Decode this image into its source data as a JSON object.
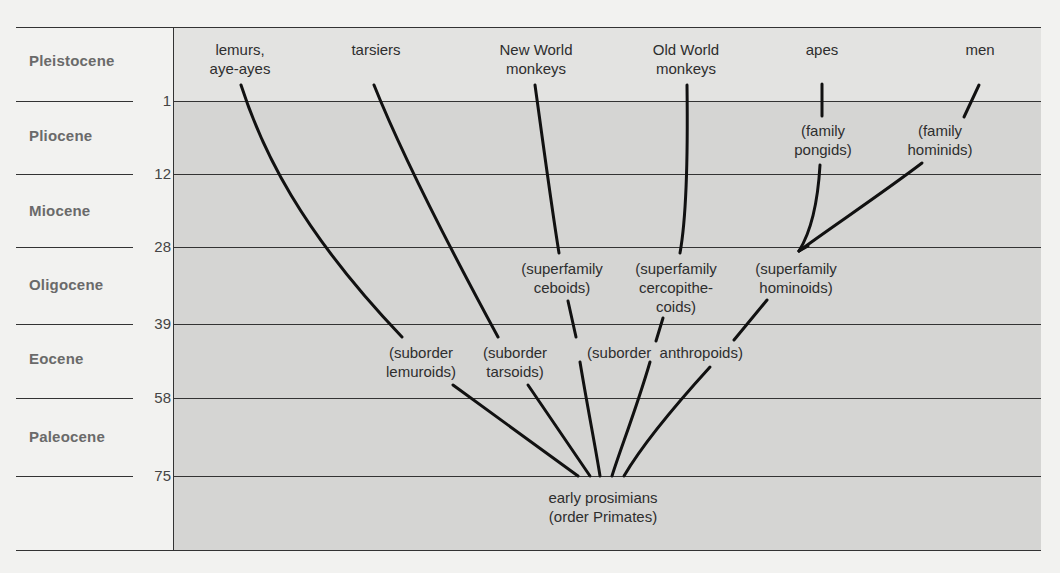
{
  "colors": {
    "page_bg": "#f2f2f0",
    "top_band": "#e3e3e1",
    "main_band": "#d5d5d3",
    "line": "#111111",
    "rule": "#333333",
    "epoch_text": "#6a6a6a"
  },
  "epochs": [
    {
      "name": "Pleistocene"
    },
    {
      "name": "Pliocene"
    },
    {
      "name": "Miocene"
    },
    {
      "name": "Oligocene"
    },
    {
      "name": "Eocene"
    },
    {
      "name": "Paleocene"
    }
  ],
  "boundaries": [
    {
      "value": "1"
    },
    {
      "value": "12"
    },
    {
      "value": "28"
    },
    {
      "value": "39"
    },
    {
      "value": "58"
    },
    {
      "value": "75"
    }
  ],
  "taxa": {
    "top": [
      {
        "label": "lemurs,\naye-ayes"
      },
      {
        "label": "tarsiers"
      },
      {
        "label": "New World\nmonkeys"
      },
      {
        "label": "Old World\nmonkeys"
      },
      {
        "label": "apes"
      },
      {
        "label": "men"
      }
    ],
    "families": [
      {
        "label": "(family\npongids)"
      },
      {
        "label": "(family\nhominids)"
      }
    ],
    "superfamilies": [
      {
        "label": "(superfamily\nceboids)"
      },
      {
        "label": "(superfamily\ncercopithe-\ncoids)"
      },
      {
        "label": "(superfamily\nhominoids)"
      }
    ],
    "suborders": [
      {
        "label": "(suborder\nlemuroids)"
      },
      {
        "label": "(suborder\ntarsoids)"
      },
      {
        "label": "(suborder  anthropoids)"
      }
    ],
    "root": {
      "label": "early prosimians\n(order Primates)"
    }
  }
}
